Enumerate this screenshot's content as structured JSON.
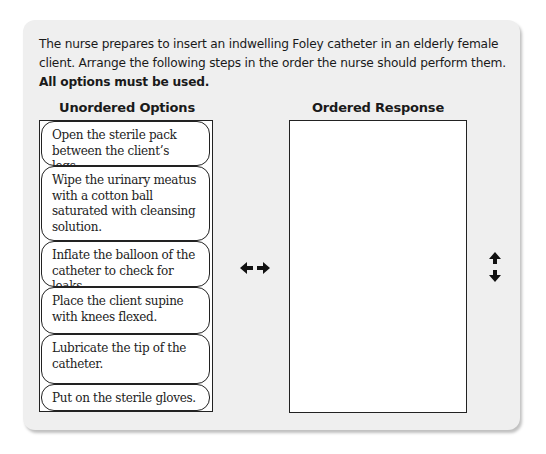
{
  "question": {
    "prompt": "The nurse prepares to insert an indwelling Foley catheter in an elderly female client. Arrange the following steps in the order the nurse should perform them.",
    "instruction": "All options must be used."
  },
  "unordered": {
    "heading": "Unordered Options",
    "options": [
      {
        "label": "Open the sterile pack between the client’s legs."
      },
      {
        "label": "Wipe the urinary meatus with a cotton ball saturated with cleansing solution."
      },
      {
        "label": "Inflate the balloon of the catheter to check for leaks."
      },
      {
        "label": "Place the client supine with knees flexed."
      },
      {
        "label": "Lubricate the tip of the catheter."
      },
      {
        "label": "Put on the sterile gloves."
      }
    ]
  },
  "ordered": {
    "heading": "Ordered Response",
    "items": []
  },
  "icons": {
    "move_horizontal": "left-right-arrow-icon",
    "move_vertical": "up-down-arrow-icon"
  }
}
